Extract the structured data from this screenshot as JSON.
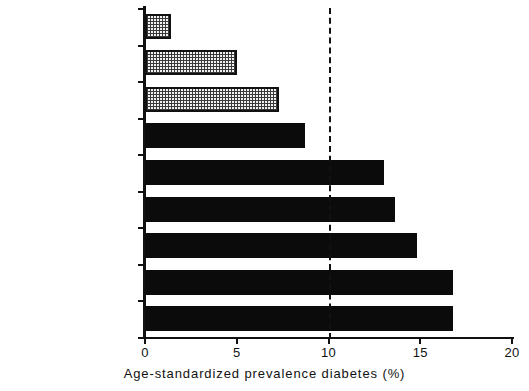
{
  "chart_data": {
    "type": "bar",
    "orientation": "horizontal",
    "title": "",
    "xlabel": "Age-standardized prevalence diabetes (%)",
    "ylabel": "",
    "xlim": [
      0,
      20
    ],
    "xticks": [
      0,
      5,
      10,
      15,
      20
    ],
    "xtick_labels": [
      "0",
      "5",
      "10",
      "15",
      "20"
    ],
    "grid": false,
    "legend": false,
    "categories": [
      "South India (Rural)",
      "Tamil Nadu (Urban)",
      "Madras (Urban)",
      "Tanzania—Dar-es-\nSalaam",
      "South Africa—Durban",
      "Singapore",
      "Fiji (Rural)",
      "Mauritius",
      "Fiji (Urban)"
    ],
    "values": [
      1.4,
      5.0,
      7.3,
      8.7,
      13.0,
      13.6,
      14.8,
      16.8,
      16.8
    ],
    "bar_styles": [
      "stipple",
      "stipple",
      "stipple",
      "solid",
      "solid",
      "solid",
      "solid",
      "solid",
      "solid"
    ],
    "annotations": [
      {
        "name": "reference-line",
        "type": "vline",
        "value": 10,
        "style": "dashed"
      }
    ]
  },
  "colors": {
    "axis": "#111111",
    "solid_bar": "#0b0b0b",
    "stipple_fill": "#f2f2f2",
    "stipple_ink": "#3a3a3a",
    "background": "#ffffff"
  }
}
